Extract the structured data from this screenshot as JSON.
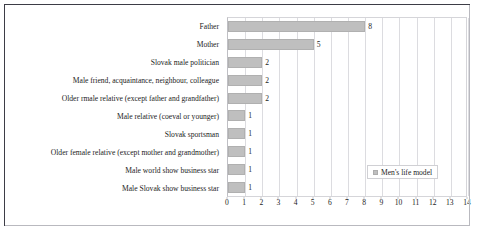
{
  "chart_data": {
    "type": "bar",
    "orientation": "horizontal",
    "title": "",
    "xlabel": "",
    "ylabel": "",
    "xlim": [
      0,
      14
    ],
    "xticks": [
      0,
      1,
      2,
      3,
      4,
      5,
      6,
      7,
      8,
      9,
      10,
      11,
      12,
      13,
      14
    ],
    "grid": true,
    "legend_position": "inside-bottom-right",
    "legend": [
      "Men's life model"
    ],
    "series": [
      {
        "name": "Men's life model",
        "color": "#bfbfbf",
        "values": [
          8,
          5,
          2,
          2,
          2,
          1,
          1,
          1,
          1,
          1
        ]
      }
    ],
    "categories": [
      "Father",
      "Mother",
      "Slovak male politician",
      "Male friend, acquaintance, neighbour, colleague",
      "Older rmale relative (except father and grandfather)",
      "Male relative (coeval or younger)",
      "Slovak sportsman",
      "Older female relative (except mother and grandmother)",
      "Male world show business star",
      "Male Slovak show business star"
    ],
    "data_labels": [
      "8",
      "5",
      "2",
      "2",
      "2",
      "1",
      "1",
      "1",
      "1",
      "1"
    ]
  },
  "colors": {
    "bar_fill": "#bfbfbf",
    "bar_border": "#b0b0b0",
    "gridline": "#dcdce0",
    "frame_border": "#3d3d46",
    "plot_border": "#d5d5d9",
    "text": "#1c1c1c"
  }
}
